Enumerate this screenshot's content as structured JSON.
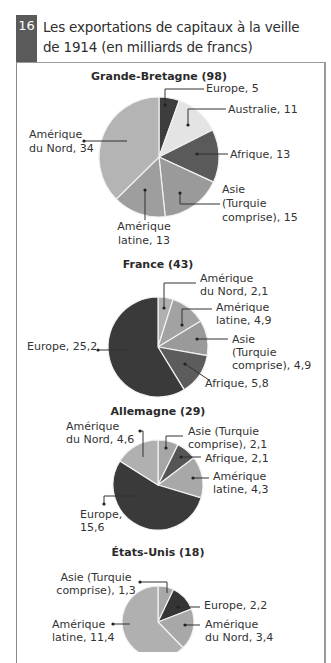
{
  "header": {
    "number": "16",
    "title_line1": "Les exportations de capitaux à la veille",
    "title_line2": "de 1914 (en milliards de francs)"
  },
  "chart_data": [
    {
      "type": "pie",
      "title": "Grande-Bretagne (98)",
      "total": 98,
      "slices": [
        {
          "label": "Europe",
          "value": 5,
          "text": [
            "Europe, 5"
          ],
          "color": "#3d3d3d"
        },
        {
          "label": "Australie",
          "value": 11,
          "text": [
            "Australie, 11"
          ],
          "color": "#e4e4e4"
        },
        {
          "label": "Afrique",
          "value": 13,
          "text": [
            "Afrique, 13"
          ],
          "color": "#5a5a5a"
        },
        {
          "label": "Asie (Turquie comprise)",
          "value": 15,
          "text": [
            "Asie",
            "(Turquie",
            "comprise), 15"
          ],
          "color": "#9a9a9a"
        },
        {
          "label": "Amérique latine",
          "value": 13,
          "text": [
            "Amérique",
            "latine, 13"
          ],
          "color": "#9e9e9e"
        },
        {
          "label": "Amérique du Nord",
          "value": 34,
          "text": [
            "Amérique",
            "du Nord, 34"
          ],
          "color": "#b4b4b4"
        }
      ]
    },
    {
      "type": "pie",
      "title": "France (43)",
      "total": 43,
      "slices": [
        {
          "label": "Amérique du Nord",
          "value": 2.1,
          "text": [
            "Amérique",
            "du Nord, 2,1"
          ],
          "color": "#b0b0b0"
        },
        {
          "label": "Amérique latine",
          "value": 4.9,
          "text": [
            "Amérique",
            "latine, 4,9"
          ],
          "color": "#a2a2a2"
        },
        {
          "label": "Asie (Turquie comprise)",
          "value": 4.9,
          "text": [
            "Asie",
            "(Turquie",
            "comprise), 4,9"
          ],
          "color": "#9a9a9a"
        },
        {
          "label": "Afrique",
          "value": 5.8,
          "text": [
            "Afrique, 5,8"
          ],
          "color": "#5c5c5c"
        },
        {
          "label": "Europe",
          "value": 25.2,
          "text": [
            "Europe, 25,2"
          ],
          "color": "#3a3a3a"
        }
      ]
    },
    {
      "type": "pie",
      "title": "Allemagne (29)",
      "total": 29,
      "slices": [
        {
          "label": "Asie (Turquie comprise)",
          "value": 2.1,
          "text": [
            "Asie (Turquie",
            "comprise), 2,1"
          ],
          "color": "#a6a6a6"
        },
        {
          "label": "Afrique",
          "value": 2.1,
          "text": [
            "Afrique, 2,1"
          ],
          "color": "#555555"
        },
        {
          "label": "Amérique latine",
          "value": 4.3,
          "text": [
            "Amérique",
            "latine, 4,3"
          ],
          "color": "#a8a8a8"
        },
        {
          "label": "Europe",
          "value": 15.6,
          "text": [
            "Europe,",
            "15,6"
          ],
          "color": "#3a3a3a"
        },
        {
          "label": "Amérique du Nord",
          "value": 4.6,
          "text": [
            "Amérique",
            "du Nord, 4,6"
          ],
          "color": "#b0b0b0"
        }
      ]
    },
    {
      "type": "pie",
      "title": "États-Unis (18)",
      "total": 18,
      "slices": [
        {
          "label": "Asie (Turquie comprise)",
          "value": 1.3,
          "text": [
            "Asie (Turquie",
            "comprise), 1,3"
          ],
          "color": "#a8a8a8"
        },
        {
          "label": "Europe",
          "value": 2.2,
          "text": [
            "Europe, 2,2"
          ],
          "color": "#353535"
        },
        {
          "label": "Amérique du Nord",
          "value": 3.4,
          "text": [
            "Amérique",
            "du Nord, 3,4"
          ],
          "color": "#a8a8a8"
        },
        {
          "label": "Amérique latine",
          "value": 11.4,
          "text": [
            "Amérique",
            "latine, 11,4"
          ],
          "color": "#b0b0b0"
        }
      ]
    }
  ]
}
